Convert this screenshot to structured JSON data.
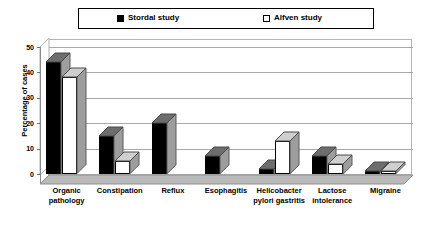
{
  "legend": {
    "entries": [
      {
        "label": "Stordal study",
        "swatch": "filled-square-icon",
        "color": "#000000"
      },
      {
        "label": "Alfven study",
        "swatch": "hollow-square-icon",
        "color": "#FFFFFF"
      }
    ]
  },
  "axis": {
    "y_title": "Percentage of cases",
    "y_ticks": [
      "0",
      "10",
      "20",
      "30",
      "40",
      "50"
    ]
  },
  "chart_data": {
    "type": "bar",
    "title": "",
    "subtitle": "",
    "xlabel": "",
    "ylabel": "Percentage of cases",
    "ylim": [
      0,
      50
    ],
    "ytick_step": 10,
    "grid": true,
    "legend_position": "top",
    "style": "3d-clustered-column",
    "categories": [
      "Organic pathology",
      "Constipation",
      "Reflux",
      "Esophagitis",
      "Helicobacter pylori gastritis",
      "Lactose intolerance",
      "Migraine"
    ],
    "category_lines": [
      [
        "Organic",
        "pathology"
      ],
      [
        "Constipation"
      ],
      [
        "Reflux"
      ],
      [
        "Esophagitis"
      ],
      [
        "Helicobacter",
        "pylori gastritis"
      ],
      [
        "Lactose",
        "intolerance"
      ],
      [
        "Migraine"
      ]
    ],
    "series": [
      {
        "name": "Stordal study",
        "color": "#000000",
        "values": [
          44,
          15,
          20,
          7,
          2,
          7,
          1
        ]
      },
      {
        "name": "Alfven study",
        "color": "#FFFFFF",
        "values": [
          38,
          5,
          0,
          0,
          13,
          4,
          1
        ]
      }
    ]
  }
}
